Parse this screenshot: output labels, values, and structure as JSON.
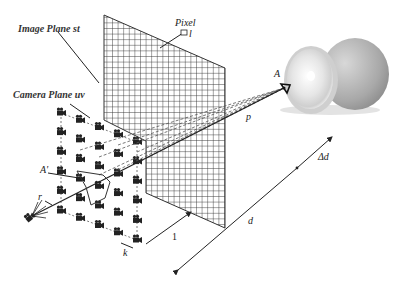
{
  "labels": {
    "image_plane": "Image Plane st",
    "camera_plane": "Camera Plane uv",
    "pixel": "Pixel",
    "pixel_size": "l",
    "point_A": "A",
    "point_A_prime": "A'",
    "ray_p": "p",
    "dist_d": "d",
    "delta_d": "Δd",
    "unit_one": "1",
    "spacing_k": "k",
    "radius_r": "r"
  },
  "colors": {
    "ink": "#222222",
    "grid": "#333333",
    "dashed": "#555555",
    "orange_light": "#e8e8e8",
    "orange_dark": "#9a9a9a"
  },
  "camera_grid": {
    "columns": 5,
    "rows": 6
  },
  "image_grid": {
    "cell_px": 5.5
  }
}
